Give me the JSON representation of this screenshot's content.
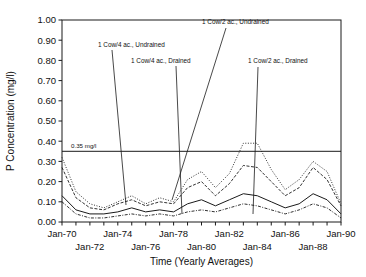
{
  "chart_data": {
    "type": "line",
    "title": "",
    "xlabel": "Time (Yearly Averages)",
    "ylabel": "P Concentration (mg/l)",
    "ylim": [
      0.0,
      1.0
    ],
    "ytick_values": [
      0.0,
      0.1,
      0.2,
      0.3,
      0.4,
      0.5,
      0.6,
      0.7,
      0.8,
      0.9,
      1.0
    ],
    "ytick_labels": [
      "0.00",
      "0.10",
      "0.20",
      "0.30",
      "0.40",
      "0.50",
      "0.60",
      "0.70",
      "0.80",
      "0.90",
      "1.00"
    ],
    "xlim": [
      1970,
      1990
    ],
    "xtick_values": [
      1970,
      1971,
      1972,
      1973,
      1974,
      1975,
      1976,
      1977,
      1978,
      1979,
      1980,
      1981,
      1982,
      1983,
      1984,
      1985,
      1986,
      1987,
      1988,
      1989,
      1990
    ],
    "xtick_labels_upper": [
      "Jan-70",
      "Jan-74",
      "Jan-78",
      "Jan-82",
      "Jan-86",
      "Jan-90"
    ],
    "xtick_labels_upper_values": [
      1970,
      1974,
      1978,
      1982,
      1986,
      1990
    ],
    "xtick_labels_lower": [
      "Jan-72",
      "Jan-76",
      "Jan-80",
      "Jan-84",
      "Jan-88"
    ],
    "xtick_labels_lower_values": [
      1972,
      1976,
      1980,
      1984,
      1988
    ],
    "grid": false,
    "legend_position": "annotations-inline",
    "x": [
      1970,
      1971,
      1972,
      1973,
      1974,
      1975,
      1976,
      1977,
      1978,
      1979,
      1980,
      1981,
      1982,
      1983,
      1984,
      1985,
      1986,
      1987,
      1988,
      1989,
      1990
    ],
    "series": [
      {
        "name": "1 Cow/2 ac., Undrained",
        "style": "dotted",
        "values": [
          0.32,
          0.15,
          0.09,
          0.07,
          0.1,
          0.13,
          0.09,
          0.12,
          0.1,
          0.21,
          0.25,
          0.17,
          0.24,
          0.39,
          0.39,
          0.26,
          0.16,
          0.21,
          0.3,
          0.25,
          0.09
        ]
      },
      {
        "name": "1 Cow/2 ac., Drained",
        "style": "dashed",
        "values": [
          0.27,
          0.12,
          0.07,
          0.06,
          0.09,
          0.11,
          0.08,
          0.1,
          0.09,
          0.17,
          0.2,
          0.13,
          0.19,
          0.28,
          0.27,
          0.2,
          0.13,
          0.17,
          0.27,
          0.21,
          0.08
        ]
      },
      {
        "name": "1 Cow/4 ac., Undrained",
        "style": "solid",
        "values": [
          0.13,
          0.06,
          0.04,
          0.04,
          0.05,
          0.07,
          0.05,
          0.06,
          0.05,
          0.09,
          0.11,
          0.08,
          0.11,
          0.14,
          0.13,
          0.1,
          0.07,
          0.09,
          0.14,
          0.11,
          0.04
        ]
      },
      {
        "name": "1 Cow/4 ac., Drained",
        "style": "dotdash",
        "values": [
          0.1,
          0.04,
          0.02,
          0.02,
          0.03,
          0.04,
          0.03,
          0.04,
          0.03,
          0.05,
          0.06,
          0.05,
          0.07,
          0.09,
          0.08,
          0.06,
          0.04,
          0.06,
          0.09,
          0.07,
          0.02
        ]
      }
    ],
    "threshold": {
      "value": 0.35,
      "label": "0.35 mg/l"
    },
    "annotations": [
      {
        "text": "1 Cow/4 ac., Undrained",
        "text_x": 98,
        "text_y": 47,
        "leader": [
          [
            112,
            50
          ],
          [
            126,
            205
          ]
        ]
      },
      {
        "text": "1 Cow/4 ac., Drained",
        "text_x": 131,
        "text_y": 63,
        "leader": [
          [
            176,
            66
          ],
          [
            182,
            214
          ]
        ]
      },
      {
        "text": "1 Cow/2 ac., Undrained",
        "text_x": 202,
        "text_y": 24,
        "leader": [
          [
            226,
            28
          ],
          [
            172,
            200
          ]
        ]
      },
      {
        "text": "1 Cow/2 ac., Drained",
        "text_x": 248,
        "text_y": 63,
        "leader": [
          [
            258,
            67
          ],
          [
            253,
            214
          ]
        ]
      }
    ]
  }
}
